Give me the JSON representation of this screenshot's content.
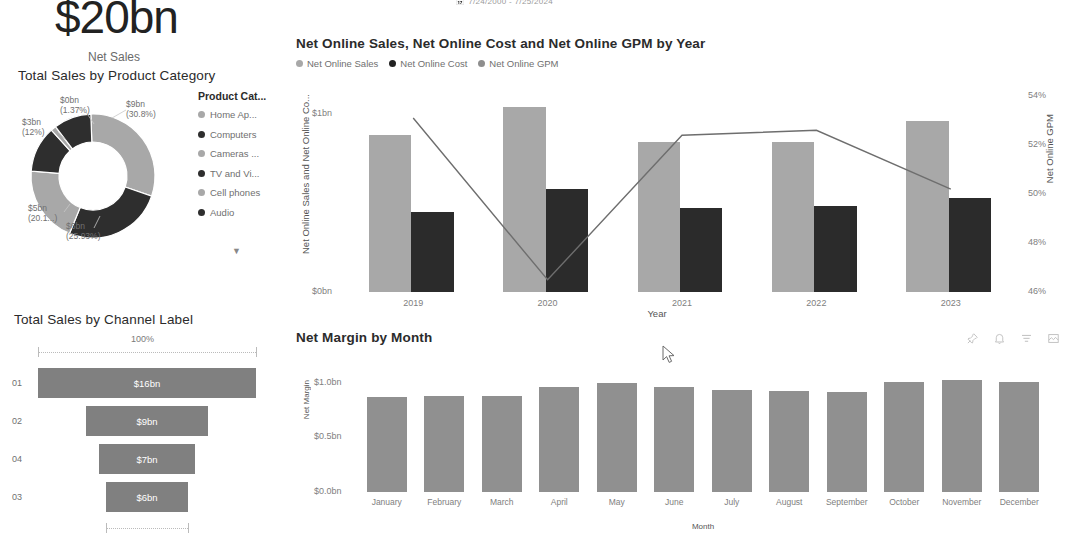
{
  "header": {
    "date_range": "7/24/2000 - 7/25/2024",
    "date_range_icon": "calendar-icon"
  },
  "kpi": {
    "value": "$20bn",
    "label": "Net Sales"
  },
  "donut": {
    "title": "Total Sales by Product Category",
    "legend_header": "Product Cat...",
    "more_icon": "chevron-down-icon",
    "chart_data": {
      "type": "pie",
      "title": "Total Sales by Product Category",
      "categories": [
        "Home Ap...",
        "Computers",
        "Cameras ...",
        "TV and Vi...",
        "Cell phones",
        "Audio"
      ],
      "values": [
        9,
        6,
        5,
        3,
        0.6,
        0.3
      ],
      "value_labels": [
        "$9bn",
        "$6bn",
        "$5bn",
        "$3bn",
        "$0bn",
        "$0bn"
      ],
      "percent_labels": [
        "(30.8%)",
        "(25.93%)",
        "(20.1...)",
        "(12%)",
        "(1.37%)",
        ""
      ],
      "percents": [
        30.8,
        25.93,
        20.1,
        12,
        1.37,
        9.8
      ],
      "colors": [
        "#a8a8a8",
        "#2e2e2e",
        "#a8a8a8",
        "#2e2e2e",
        "#a8a8a8",
        "#2e2e2e"
      ],
      "legend_position": "right"
    },
    "slices": [
      {
        "value": "$9bn",
        "percent": "(30.8%)"
      },
      {
        "value": "$6bn",
        "percent": "(25.93%)"
      },
      {
        "value": "$5bn",
        "percent": "(20.1...)"
      },
      {
        "value": "$3bn",
        "percent": "(12%)"
      },
      {
        "value": "$0bn",
        "percent": "(1.37%)"
      }
    ]
  },
  "combo": {
    "title": "Net Online Sales, Net Online Cost and Net Online GPM by Year",
    "legend": [
      "Net Online Sales",
      "Net Online Cost",
      "Net Online GPM"
    ],
    "ylabel_left": "Net Online Sales and Net Online Co...",
    "ylabel_right": "Net Online GPM",
    "xlabel": "Year",
    "chart_data": {
      "type": "bar",
      "title": "Net Online Sales, Net Online Cost and Net Online GPM by Year",
      "categories": [
        "2019",
        "2020",
        "2021",
        "2022",
        "2023"
      ],
      "series": [
        {
          "name": "Net Online Sales",
          "values": [
            0.88,
            1.04,
            0.84,
            0.84,
            0.96
          ],
          "color": "#a8a8a8",
          "axis": "left"
        },
        {
          "name": "Net Online Cost",
          "values": [
            0.45,
            0.58,
            0.47,
            0.48,
            0.53
          ],
          "color": "#2b2b2b",
          "axis": "left"
        },
        {
          "name": "Net Online GPM",
          "values": [
            53.1,
            46.5,
            52.4,
            52.6,
            50.2
          ],
          "color": "#6e6e6e",
          "axis": "right",
          "type": "line"
        }
      ],
      "ylabel": "Net Online Sales and Net Online Co...",
      "ylabel_right": "Net Online GPM",
      "xlabel": "Year",
      "ylim": [
        0,
        1.1
      ],
      "yticks": [
        "$0bn",
        "$1bn"
      ],
      "ytick_values": [
        0,
        1
      ],
      "ylim_right": [
        46,
        54
      ],
      "yticks_right": [
        "46%",
        "48%",
        "50%",
        "52%",
        "54%"
      ],
      "ytick_values_right": [
        46,
        48,
        50,
        52,
        54
      ],
      "grid": false,
      "legend_position": "top"
    }
  },
  "funnel": {
    "title": "Total Sales by Channel Label",
    "top_percent": "100%",
    "bottom_percent": "40%",
    "chart_data": {
      "type": "bar",
      "title": "Total Sales by Channel Label",
      "categories": [
        "01",
        "02",
        "04",
        "03"
      ],
      "values": [
        16,
        9,
        7,
        6
      ],
      "value_labels": [
        "$16bn",
        "$9bn",
        "$7bn",
        "$6bn"
      ],
      "top_percent": "100%",
      "bottom_percent": "40%",
      "color": "#808080",
      "ylabel": "",
      "xlabel": ""
    }
  },
  "month": {
    "title": "Net Margin by Month",
    "tools": [
      {
        "name": "pin-icon",
        "label": "Pin visual"
      },
      {
        "name": "alert-icon",
        "label": "Alerts"
      },
      {
        "name": "filter-icon",
        "label": "Filters"
      },
      {
        "name": "focus-mode-icon",
        "label": "Focus mode"
      }
    ],
    "chart_data": {
      "type": "bar",
      "title": "Net Margin by Month",
      "categories": [
        "January",
        "February",
        "March",
        "April",
        "May",
        "June",
        "July",
        "August",
        "September",
        "October",
        "November",
        "December"
      ],
      "values": [
        0.87,
        0.88,
        0.88,
        0.965,
        1.0,
        0.96,
        0.935,
        0.925,
        0.915,
        1.005,
        1.025,
        1.01
      ],
      "ylabel": "Net Margin",
      "xlabel": "Month",
      "ylim": [
        0,
        1.1
      ],
      "yticks": [
        "$0.0bn",
        "$0.5bn",
        "$1.0bn"
      ],
      "ytick_values": [
        0,
        0.5,
        1.0
      ],
      "color": "#909090",
      "grid": false
    }
  },
  "cursor": {
    "name": "mouse-pointer",
    "x": 662,
    "y": 345
  }
}
